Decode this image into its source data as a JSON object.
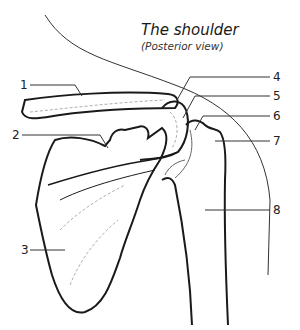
{
  "title": "The shoulder",
  "subtitle": "(Posterior view)",
  "labels": [
    {
      "id": 1,
      "text": "1"
    },
    {
      "id": 2,
      "text": "2"
    },
    {
      "id": 3,
      "text": "3"
    },
    {
      "id": 4,
      "text": "4"
    },
    {
      "id": 5,
      "text": "5"
    },
    {
      "id": 6,
      "text": "6"
    },
    {
      "id": 7,
      "text": "7"
    },
    {
      "id": 8,
      "text": "8"
    }
  ],
  "colors": {
    "ink": "#1a1a1a",
    "fine": "#555555",
    "dashed": "#999999"
  }
}
